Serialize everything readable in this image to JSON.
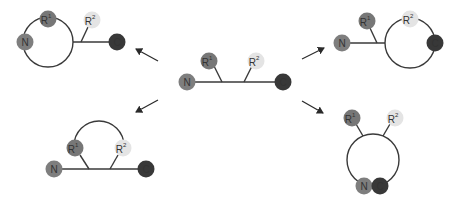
{
  "colors": {
    "N": "#7e7e7e",
    "R1": "#777777",
    "R2": "#e4e4e4",
    "C": "#383838",
    "line": "#3a3a3a",
    "background": "#ffffff"
  },
  "labels": {
    "N": "N",
    "R": "R",
    "C": "C",
    "sup1": "1",
    "sup2": "2"
  },
  "panels": [
    {
      "id": "center",
      "description": "Linear peptide: N-terminus, R1 side chain, R2 side chain, C-terminus"
    },
    {
      "id": "top-left",
      "description": "Cyclization between N-terminus and side chain R1 (head-to-side-chain)"
    },
    {
      "id": "top-right",
      "description": "Cyclization between side chain R2 and C-terminus (side-chain-to-tail)"
    },
    {
      "id": "bottom-left",
      "description": "Cyclization between side chains R1 and R2 (side-chain-to-side-chain)"
    },
    {
      "id": "bottom-right",
      "description": "Cyclization between N-terminus and C-terminus (head-to-tail)"
    }
  ]
}
